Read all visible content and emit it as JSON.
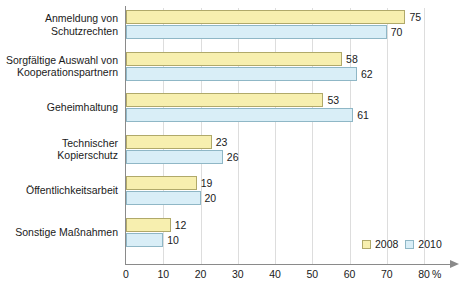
{
  "chart_data": {
    "type": "bar",
    "orientation": "horizontal",
    "title": "",
    "xlabel": "%",
    "ylabel": "",
    "xlim": [
      0,
      80
    ],
    "xticks": [
      0,
      10,
      20,
      30,
      40,
      50,
      60,
      70,
      80
    ],
    "grid": true,
    "legend_position": "bottom-right",
    "categories": [
      "Anmeldung von Schutzrechten",
      "Sorgfältige Auswahl von Kooperationspartnern",
      "Geheimhaltung",
      "Technischer Kopierschutz",
      "Öffentlichkeitsarbeit",
      "Sonstige Maßnahmen"
    ],
    "category_lines": [
      [
        "Anmeldung von",
        "Schutzrechten"
      ],
      [
        "Sorgfältige Auswahl von",
        "Kooperationspartnern"
      ],
      [
        "Geheimhaltung"
      ],
      [
        "Technischer",
        "Kopierschutz"
      ],
      [
        "Öffentlichkeitsarbeit"
      ],
      [
        "Sonstige Maßnahmen"
      ]
    ],
    "series": [
      {
        "name": "2008",
        "color": "#f7efaf",
        "border": "#b0a96a",
        "values": [
          75,
          58,
          53,
          23,
          19,
          12
        ]
      },
      {
        "name": "2010",
        "color": "#d9eef7",
        "border": "#8fb7c6",
        "values": [
          70,
          62,
          61,
          26,
          20,
          10
        ]
      }
    ]
  },
  "axis": {
    "unit_label": "%",
    "tick_labels": [
      "0",
      "10",
      "20",
      "30",
      "40",
      "50",
      "60",
      "70",
      "80"
    ]
  },
  "legend": {
    "items": [
      {
        "label": "2008"
      },
      {
        "label": "2010"
      }
    ]
  },
  "caption": {
    "text": ""
  }
}
